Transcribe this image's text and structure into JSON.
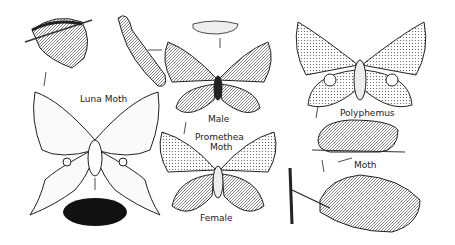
{
  "illustration": {
    "subject": "Moth life cycles illustration",
    "labels": {
      "luna": "Luna Moth",
      "male": "Male",
      "promethea_line1": "Promethea",
      "promethea_line2": "Moth",
      "female": "Female",
      "polyphemus": "Polyphemus",
      "moth": "Moth"
    }
  }
}
